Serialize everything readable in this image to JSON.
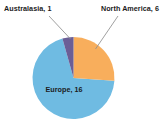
{
  "chart_data": {
    "type": "pie",
    "title": "",
    "subtitle": "",
    "xlabel": "",
    "ylabel": "",
    "legend_position": "none",
    "grid": false,
    "total": 23,
    "start_angle_deg": 0,
    "direction": "clockwise",
    "categories": [
      "North America",
      "Europe",
      "Australasia"
    ],
    "values": [
      6,
      16,
      1
    ],
    "colors": [
      "#F8AE5C",
      "#6FBBE2",
      "#6B5E96"
    ],
    "slices": [
      {
        "name": "North America",
        "value": 6,
        "label": "North America, 6",
        "color": "#F8AE5C",
        "percent": 26.1,
        "angle_deg": 93.9,
        "start_deg": 0,
        "end_deg": 93.9,
        "label_placement": "outside-upper-right",
        "has_leader_line": true
      },
      {
        "name": "Europe",
        "value": 16,
        "label": "Europe, 16",
        "color": "#6FBBE2",
        "percent": 69.6,
        "angle_deg": 250.4,
        "start_deg": 93.9,
        "end_deg": 344.3,
        "label_placement": "inside",
        "has_leader_line": false
      },
      {
        "name": "Australasia",
        "value": 1,
        "label": "Australasia, 1",
        "color": "#6B5E96",
        "percent": 4.3,
        "angle_deg": 15.7,
        "start_deg": 344.3,
        "end_deg": 360,
        "label_placement": "outside-upper-left",
        "has_leader_line": true
      }
    ]
  },
  "labels": {
    "australasia": "Australasia, 1",
    "north_america": "North America, 6",
    "europe": "Europe, 16"
  },
  "colors": {
    "background": "#ffffff",
    "blue": "#6FBBE2",
    "orange": "#F8AE5C",
    "purple": "#6B5E96",
    "leader_line": "#8f8f8f",
    "text": "#1b1b1b"
  }
}
